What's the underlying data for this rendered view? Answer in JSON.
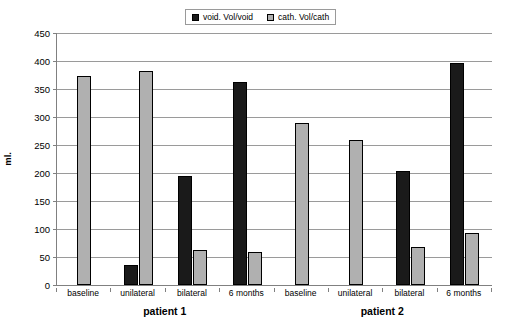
{
  "chart_data": {
    "type": "bar",
    "title": "",
    "xlabel": "",
    "ylabel": "ml.",
    "ylim": [
      0,
      450
    ],
    "ytick_step": 50,
    "yticks": [
      450,
      400,
      350,
      300,
      250,
      200,
      150,
      100,
      50,
      0
    ],
    "ytick_labels": [
      "450",
      "400",
      "350",
      "300",
      "250",
      "200",
      "150",
      "100",
      "50",
      "0"
    ],
    "grid": true,
    "legend_position": "top-center",
    "categories": [
      "baseline",
      "unilateral",
      "bilateral",
      "6 months"
    ],
    "groups": [
      {
        "name": "patient 1",
        "categories": [
          "baseline",
          "unilateral",
          "bilateral",
          "6 months"
        ],
        "series": [
          {
            "name": "void. Vol/void",
            "values": [
              0,
              36,
              195,
              363
            ]
          },
          {
            "name": "cath. Vol/cath",
            "values": [
              373,
              382,
              62,
              59
            ]
          }
        ]
      },
      {
        "name": "patient 2",
        "categories": [
          "baseline",
          "unilateral",
          "bilateral",
          "6 months"
        ],
        "series": [
          {
            "name": "void. Vol/void",
            "values": [
              0,
              0,
              203,
              397
            ]
          },
          {
            "name": "cath. Vol/cath",
            "values": [
              290,
              259,
              67,
              93
            ]
          }
        ]
      }
    ],
    "series": [
      {
        "name": "void. Vol/void",
        "color": "#1a1a1a"
      },
      {
        "name": "cath. Vol/cath",
        "color": "#b0b0b0"
      }
    ]
  },
  "legend": {
    "entries": [
      {
        "label": "void. Vol/void",
        "color": "#1a1a1a"
      },
      {
        "label": "cath. Vol/cath",
        "color": "#b0b0b0"
      }
    ]
  },
  "axis": {
    "y_title": "ml.",
    "y_labels": [
      "450",
      "400",
      "350",
      "300",
      "250",
      "200",
      "150",
      "100",
      "50",
      "0"
    ]
  },
  "category_labels": [
    "baseline",
    "unilateral",
    "bilateral",
    "6 months",
    "baseline",
    "unilateral",
    "bilateral",
    "6 months"
  ],
  "group_labels": [
    "patient 1",
    "patient 2"
  ],
  "colors": {
    "void": "#1a1a1a",
    "cath": "#b0b0b0",
    "grid": "#9a9a9a",
    "axis": "#808080",
    "background": "#ffffff"
  }
}
